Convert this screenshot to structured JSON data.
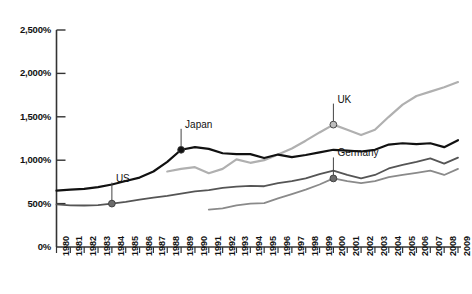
{
  "chart_data": {
    "type": "line",
    "title": "",
    "xlabel": "",
    "ylabel": "",
    "ylim": [
      0,
      2500
    ],
    "yticks": [
      0,
      500,
      1000,
      1500,
      2000,
      2500
    ],
    "ytick_labels": [
      "0%",
      "500%",
      "1,000%",
      "1,500%",
      "2,000%",
      "2,500%"
    ],
    "grid": false,
    "legend_position": "inline-annotations",
    "x": [
      1980,
      1981,
      1982,
      1983,
      1984,
      1985,
      1986,
      1987,
      1988,
      1989,
      1990,
      1991,
      1992,
      1993,
      1994,
      1995,
      1996,
      1997,
      1998,
      1999,
      2000,
      2001,
      2002,
      2003,
      2004,
      2005,
      2006,
      2007,
      2008,
      2009
    ],
    "xtick_labels": [
      "1980",
      "1981",
      "1982",
      "1983",
      "1984",
      "1985",
      "1986",
      "1987",
      "1988",
      "1989",
      "1990",
      "1991",
      "1992",
      "1993",
      "1994",
      "1995",
      "1996",
      "1997",
      "1998",
      "1999",
      "2000",
      "2001",
      "2002",
      "2003",
      "2004",
      "2005",
      "2006",
      "2007",
      "2008",
      "2009"
    ],
    "series": [
      {
        "name": "Japan",
        "color": "#111111",
        "width": 2.2,
        "start_year": 1980,
        "values": [
          650,
          660,
          670,
          690,
          720,
          760,
          800,
          870,
          980,
          1120,
          1150,
          1130,
          1080,
          1070,
          1070,
          1025,
          1065,
          1035,
          1060,
          1090,
          1120,
          1110,
          1100,
          1120,
          1180,
          1195,
          1185,
          1195,
          1150,
          1230
        ],
        "marker": {
          "year": 1989,
          "value": 1120,
          "style": "filled-dark"
        }
      },
      {
        "name": "UK",
        "color": "#b0b0b0",
        "width": 2.2,
        "start_year": 1988,
        "values": [
          null,
          null,
          null,
          null,
          null,
          null,
          null,
          null,
          870,
          900,
          920,
          850,
          900,
          1010,
          970,
          1000,
          1065,
          1135,
          1225,
          1320,
          1410,
          1350,
          1290,
          1350,
          1500,
          1640,
          1740,
          1790,
          1840,
          1900
        ],
        "marker": {
          "year": 2000,
          "value": 1410,
          "style": "filled-light"
        }
      },
      {
        "name": "US",
        "color": "#555555",
        "width": 1.8,
        "start_year": 1980,
        "values": [
          490,
          480,
          478,
          482,
          500,
          520,
          545,
          570,
          590,
          615,
          640,
          655,
          680,
          695,
          705,
          700,
          735,
          760,
          790,
          840,
          880,
          830,
          790,
          830,
          905,
          945,
          980,
          1020,
          960,
          1030
        ],
        "marker": {
          "year": 1984,
          "value": 500,
          "style": "filled-medium"
        }
      },
      {
        "name": "Germany",
        "color": "#8a8a8a",
        "width": 1.8,
        "start_year": 1991,
        "values": [
          null,
          null,
          null,
          null,
          null,
          null,
          null,
          null,
          null,
          null,
          null,
          430,
          445,
          480,
          500,
          505,
          560,
          610,
          660,
          720,
          790,
          760,
          735,
          760,
          805,
          830,
          855,
          880,
          830,
          900
        ],
        "marker": {
          "year": 2000,
          "value": 790,
          "style": "filled-medium"
        }
      }
    ],
    "annotations": [
      {
        "label": "Japan",
        "series": "Japan",
        "year": 1989,
        "value": 1120
      },
      {
        "label": "US",
        "series": "US",
        "year": 1984,
        "value": 500
      },
      {
        "label": "UK",
        "series": "UK",
        "year": 2000,
        "value": 1410
      },
      {
        "label": "Germany",
        "series": "Germany",
        "year": 2000,
        "value": 790
      }
    ]
  },
  "axis": {
    "axis_color": "#333333",
    "tick_color": "#333333"
  }
}
